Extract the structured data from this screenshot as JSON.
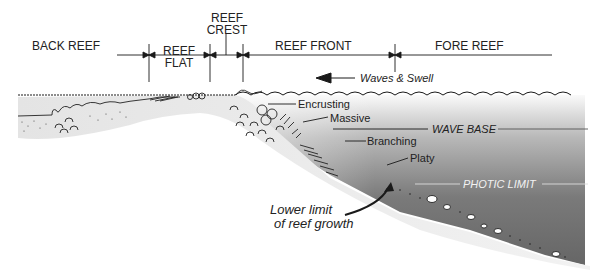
{
  "zones": {
    "back_reef": "BACK REEF",
    "reef_flat_1": "REEF",
    "reef_flat_2": "FLAT",
    "reef_crest_1": "REEF",
    "reef_crest_2": "CREST",
    "reef_front": "REEF FRONT",
    "fore_reef": "FORE REEF"
  },
  "annotations": {
    "waves": "Waves & Swell",
    "encrusting": "Encrusting",
    "massive": "Massive",
    "branching": "Branching",
    "platy": "Platy",
    "wave_base": "WAVE BASE",
    "photic_limit": "PHOTIC LIMIT",
    "lower_limit_1": "Lower limit",
    "lower_limit_2": "of reef growth"
  },
  "colors": {
    "deep_water": "#6e6e6e",
    "shallow_water": "#f0f0f0",
    "sediment": "#e6e6e6",
    "line": "#1a1a1a"
  }
}
